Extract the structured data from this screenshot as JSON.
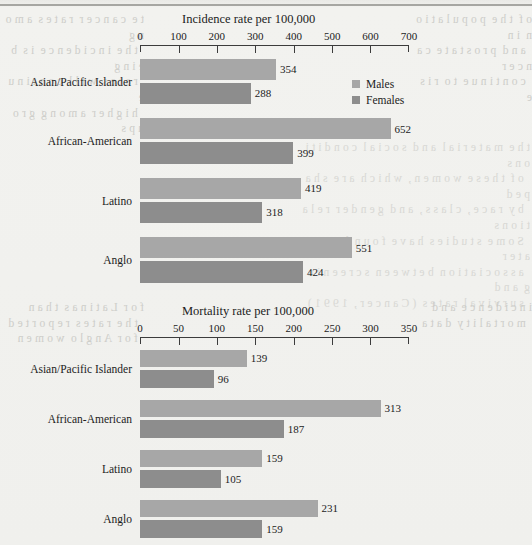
{
  "page": {
    "ghost_text_left": "t e  c a n c e r  r a t e s  a m o n g\n  t h e  i n c i d e n c e  i s  b e i n g\n  r a t e s  w i l l  c o n t i n u e\n  h i g h e r  a m o n g  g r o u p s",
    "ghost_text_right": "o f  t h e  p o p u l a t i o n  i n\n  a n d  p r o s t a t e  c a n c e r\n  c o n t i n u e  t o  r i s e",
    "ghost_text_mid_left": "f o r  L a t i n a s  t h a n\n  t h e  r a t e s  r e p o r t e d\n  f o r  A n g l o  w o m e n",
    "ghost_text_mid_right": "i n c i d e n c e  a n d\n  m o r t a l i t y  d a t a",
    "ghost_text_body_right": "t h e  m a t e r i a l  a n d  s o c i a l  c o n d i t i o n s\n  o f  t h e s e  w o m e n ,  w h i c h  a r e  s h a p e d\n  b y  r a c e ,  c l a s s ,  a n d  g e n d e r  r e l a t i o n s\n  S o m e  s t u d i e s  h a v e  f o u n d  a  g r e a t e r\n  a s s o c i a t i o n  b e t w e e n  s c r e e n i n g  a n d\n  s u r v i v a l  r a t e s  ( C a n c e r ,  1 9 9 1 )"
  },
  "legend": {
    "items": [
      {
        "label": "Males",
        "color": "#a7a7a7",
        "key": "males"
      },
      {
        "label": "Females",
        "color": "#8d8d8d",
        "key": "females"
      }
    ]
  },
  "chart_data": [
    {
      "id": "incidence",
      "type": "bar",
      "orientation": "horizontal",
      "title": "Incidence rate per 100,000",
      "xlabel": "",
      "ylabel": "",
      "xlim": [
        0,
        700
      ],
      "xticks": [
        0,
        100,
        200,
        300,
        400,
        500,
        600,
        700
      ],
      "grid": false,
      "legend_position": "top-right",
      "categories": [
        "Asian/Pacific Islander",
        "African-American",
        "Latino",
        "Anglo"
      ],
      "series": [
        {
          "name": "Males",
          "color": "#a7a7a7",
          "values": [
            354,
            652,
            419,
            551
          ]
        },
        {
          "name": "Females",
          "color": "#8d8d8d",
          "values": [
            288,
            399,
            318,
            424
          ]
        }
      ]
    },
    {
      "id": "mortality",
      "type": "bar",
      "orientation": "horizontal",
      "title": "Mortality rate per 100,000",
      "xlabel": "",
      "ylabel": "",
      "xlim": [
        0,
        350
      ],
      "xticks": [
        0,
        50,
        100,
        150,
        200,
        250,
        300,
        350
      ],
      "grid": false,
      "legend_position": "top-right",
      "categories": [
        "Asian/Pacific Islander",
        "African-American",
        "Latino",
        "Anglo"
      ],
      "series": [
        {
          "name": "Males",
          "color": "#a7a7a7",
          "values": [
            139,
            313,
            159,
            231
          ]
        },
        {
          "name": "Females",
          "color": "#8d8d8d",
          "values": [
            96,
            187,
            105,
            159
          ]
        }
      ]
    }
  ]
}
